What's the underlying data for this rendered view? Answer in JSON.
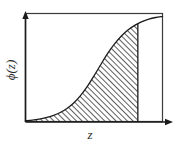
{
  "figure": {
    "title": "",
    "background_color": "#ffffff",
    "line_color": "#1a1a1a",
    "frame_color": "#3b3b3b",
    "hatch_color": "#2a2a2a",
    "axes": {
      "x_label": "z",
      "y_label": "ϕ(z)",
      "x_axis_name": "z-axis",
      "y_axis_name": "phi-of-z-axis",
      "x_arrow": "right",
      "y_arrow": "up",
      "ticks_shown": false,
      "tick_labels_x": [],
      "tick_labels_y": [],
      "grid": false
    },
    "shaded_region": {
      "label": "",
      "description": "hatched area under curve",
      "hatch_angle_degrees": 45,
      "hatch_direction": "forward-slash",
      "x_start": 0,
      "x_end": 0.82
    }
  },
  "chart_data": {
    "type": "line",
    "title": "",
    "xlabel": "z",
    "ylabel": "ϕ(z)",
    "xlim": [
      0,
      1
    ],
    "ylim": [
      0,
      1
    ],
    "grid": false,
    "legend_position": "none",
    "fill_to_x": 0.82,
    "series": [
      {
        "name": "ϕ(z)",
        "x": [
          0.0,
          0.05,
          0.1,
          0.15,
          0.2,
          0.25,
          0.3,
          0.35,
          0.4,
          0.45,
          0.5,
          0.55,
          0.6,
          0.65,
          0.7,
          0.75,
          0.8,
          0.85,
          0.9,
          0.95,
          1.0
        ],
        "values": [
          0.012,
          0.018,
          0.027,
          0.04,
          0.058,
          0.085,
          0.122,
          0.172,
          0.24,
          0.325,
          0.425,
          0.53,
          0.632,
          0.72,
          0.793,
          0.85,
          0.893,
          0.925,
          0.948,
          0.963,
          0.972
        ]
      }
    ]
  }
}
